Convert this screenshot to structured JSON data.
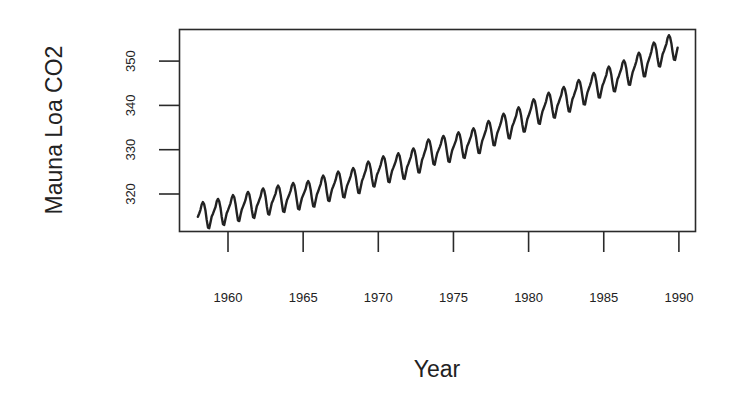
{
  "chart_data": {
    "type": "line",
    "title": "",
    "xlabel": "Year",
    "ylabel": "Mauna Loa CO2",
    "xlim": [
      1956.75,
      1991.1
    ],
    "ylim": [
      311.3,
      357.0
    ],
    "x_ticks": [
      1960,
      1965,
      1970,
      1975,
      1980,
      1985,
      1990
    ],
    "x_tick_labels": [
      "1960",
      "1965",
      "1970",
      "1975",
      "1980",
      "1985",
      "1990"
    ],
    "y_ticks": [
      320,
      330,
      340,
      350
    ],
    "y_tick_labels": [
      "320",
      "330",
      "340",
      "350"
    ],
    "grid": false,
    "legend": null,
    "series": [
      {
        "name": "Mauna Loa CO2 (monthly, ppm)",
        "start": 1958.0,
        "end": 1989.92,
        "frequency": 12,
        "annual_means": {
          "1958": 315.3,
          "1959": 316.0,
          "1960": 316.9,
          "1961": 317.6,
          "1962": 318.4,
          "1963": 319.0,
          "1964": 319.6,
          "1965": 320.0,
          "1966": 321.4,
          "1967": 322.2,
          "1968": 323.0,
          "1969": 324.6,
          "1970": 325.7,
          "1971": 326.3,
          "1972": 327.5,
          "1973": 329.7,
          "1974": 330.2,
          "1975": 331.1,
          "1976": 332.0,
          "1977": 333.8,
          "1978": 335.4,
          "1979": 336.8,
          "1980": 338.7,
          "1981": 340.1,
          "1982": 341.4,
          "1983": 343.0,
          "1984": 344.6,
          "1985": 346.0,
          "1986": 347.4,
          "1987": 349.2,
          "1988": 351.6,
          "1989": 353.1
        },
        "seasonal_offsets_by_month": [
          -0.1,
          0.6,
          1.3,
          2.5,
          3.0,
          2.4,
          0.9,
          -1.2,
          -3.0,
          -3.2,
          -1.9,
          -0.7
        ],
        "color": "#222222"
      }
    ]
  }
}
